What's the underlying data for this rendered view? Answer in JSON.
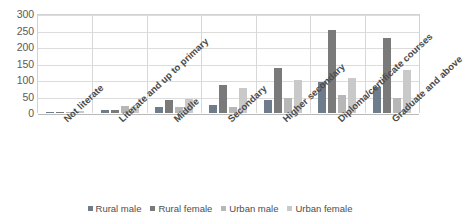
{
  "chart_data": {
    "type": "bar",
    "title": "",
    "xlabel": "",
    "ylabel": "",
    "ylim": [
      0,
      300
    ],
    "yticks": [
      0,
      50,
      100,
      150,
      200,
      250,
      300
    ],
    "grid": true,
    "legend_position": "bottom",
    "categories": [
      "Not literate",
      "Literate and up to primary",
      "Middle",
      "Secondary",
      "Higher secondary",
      "Diploma/certificate courses",
      "Graduate and above"
    ],
    "series": [
      {
        "name": "Rural male",
        "color": "#6E7C8C",
        "values": [
          3,
          9,
          17,
          23,
          39,
          95,
          78
        ]
      },
      {
        "name": "Rural female",
        "color": "#7A7A7A",
        "values": [
          4,
          9,
          39,
          85,
          135,
          252,
          228
        ]
      },
      {
        "name": "Urban male",
        "color": "#B7B7B7",
        "values": [
          4,
          20,
          19,
          17,
          47,
          54,
          47
        ]
      },
      {
        "name": "Urban female",
        "color": "#C9C9C9",
        "values": [
          6,
          19,
          42,
          77,
          100,
          107,
          130
        ]
      }
    ]
  },
  "axis": {
    "y_tick_labels": [
      "300",
      "250",
      "200",
      "150",
      "100",
      "50",
      "0"
    ]
  }
}
